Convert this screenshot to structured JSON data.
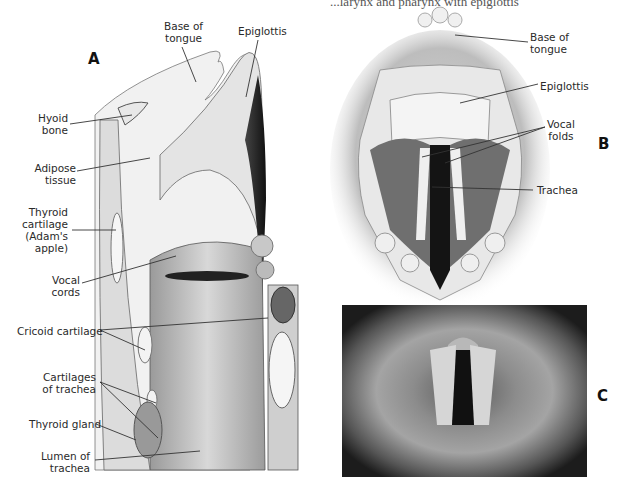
{
  "header_fragment": "...larynx and pharynx with epiglottis",
  "panels": {
    "A": {
      "letter": "A",
      "labels": {
        "base_of_tongue": "Base of\ntongue",
        "epiglottis": "Epiglottis",
        "hyoid_bone": "Hyoid\nbone",
        "adipose_tissue": "Adipose\ntissue",
        "thyroid_cartilage": "Thyroid\ncartilage\n(Adam's\napple)",
        "vocal_cords": "Vocal\ncords",
        "cricoid_cartilage": "Cricoid cartilage",
        "cartilages_of_trachea": "Cartilages\nof trachea",
        "thyroid_gland": "Thyroid gland",
        "lumen_of_trachea": "Lumen of\ntrachea"
      }
    },
    "B": {
      "letter": "B",
      "labels": {
        "base_of_tongue": "Base of\ntongue",
        "epiglottis": "Epiglottis",
        "vocal_folds": "Vocal\nfolds",
        "trachea": "Trachea"
      }
    },
    "C": {
      "letter": "C",
      "description": "Laryngoscopic photograph of vocal folds"
    }
  },
  "colors": {
    "background": "#ffffff",
    "text": "#2a2a2a",
    "photo_dark": "#1a1a1a",
    "photo_mid": "#7a7a7a"
  }
}
